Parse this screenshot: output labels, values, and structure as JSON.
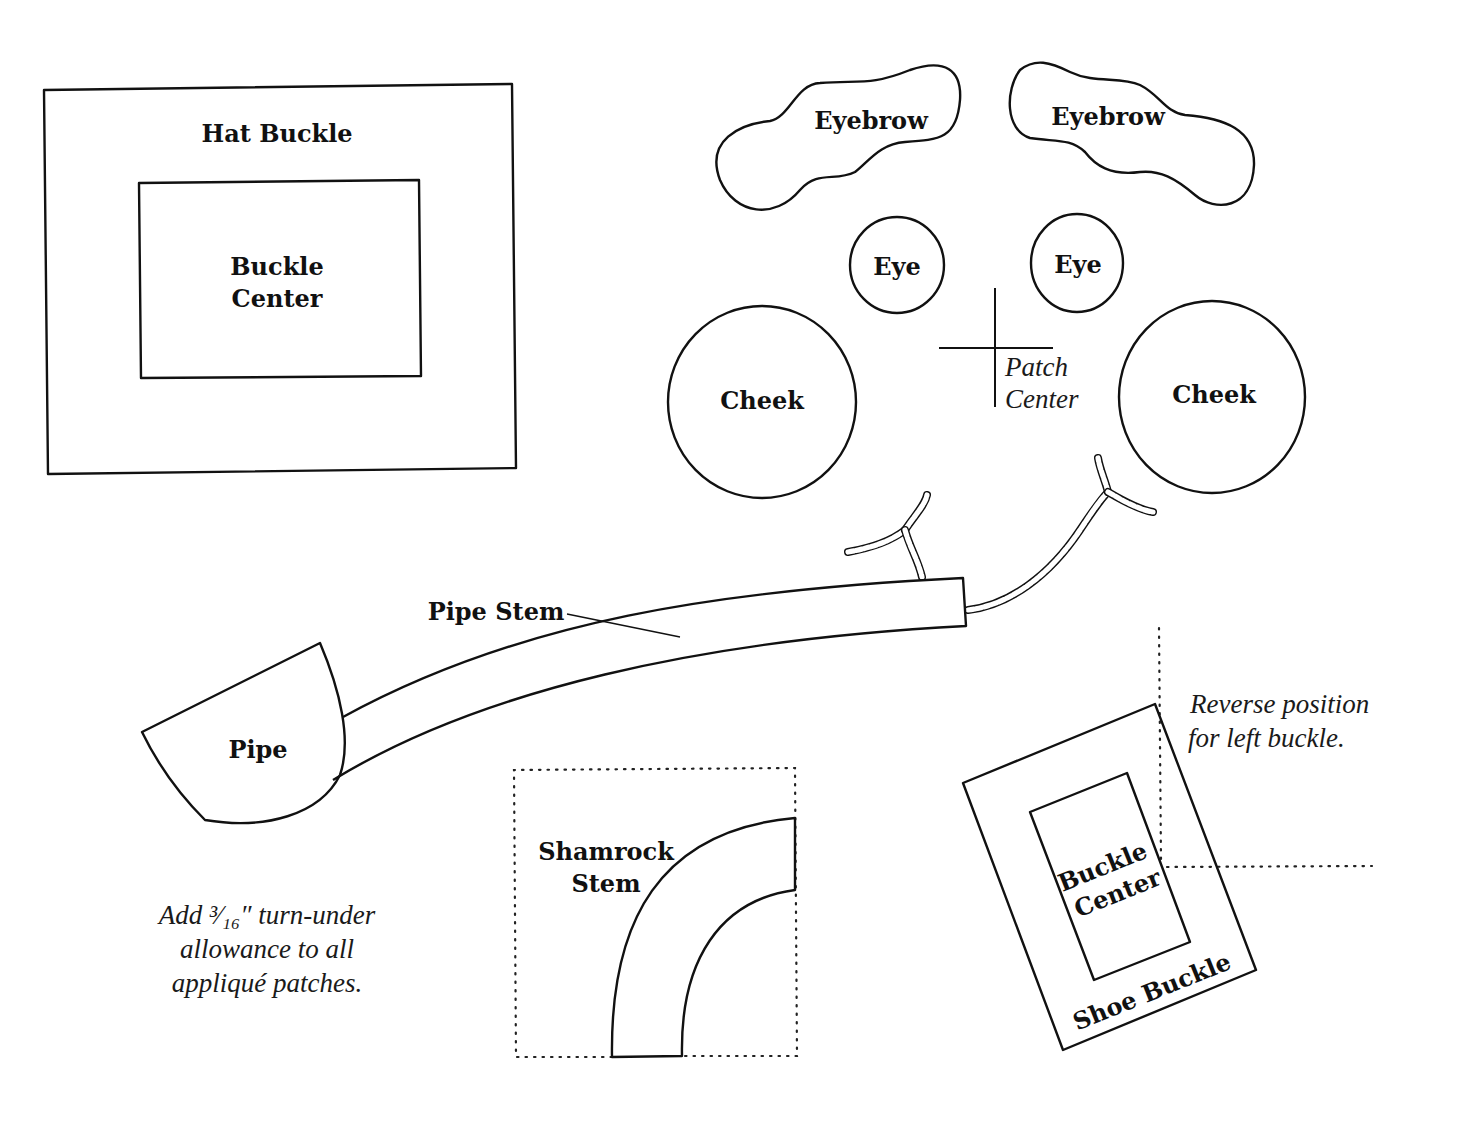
{
  "diagram": {
    "type": "applique-pattern-pieces",
    "pieces": {
      "hat_buckle": {
        "label": "Hat Buckle",
        "center_label_1": "Buckle",
        "center_label_2": "Center"
      },
      "eyebrow_left": {
        "label": "Eyebrow"
      },
      "eyebrow_right": {
        "label": "Eyebrow"
      },
      "eye_left": {
        "label": "Eye"
      },
      "eye_right": {
        "label": "Eye"
      },
      "cheek_left": {
        "label": "Cheek"
      },
      "cheek_right": {
        "label": "Cheek"
      },
      "patch_center": {
        "label_1": "Patch",
        "label_2": "Center"
      },
      "pipe_stem": {
        "label": "Pipe Stem"
      },
      "pipe": {
        "label": "Pipe"
      },
      "shamrock_stem": {
        "label_1": "Shamrock",
        "label_2": "Stem"
      },
      "shoe_buckle": {
        "label": "Shoe Buckle",
        "center_label_1": "Buckle",
        "center_label_2": "Center"
      }
    },
    "notes": {
      "reverse": [
        "Reverse position",
        "for left buckle."
      ],
      "allowance": [
        "Add ³⁄₁₆″ turn-under",
        "allowance to all",
        "appliqué patches."
      ]
    },
    "embroidery": [
      "smoke-rope-left",
      "smoke-rope-right"
    ]
  }
}
